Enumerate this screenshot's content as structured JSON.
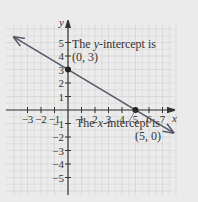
{
  "chart_data": {
    "type": "line",
    "title": "",
    "xlabel": "x",
    "ylabel": "y",
    "xlim": [
      -4,
      8
    ],
    "ylim": [
      -6,
      6
    ],
    "grid": true,
    "x_ticks": [
      -3,
      -2,
      -1,
      1,
      2,
      3,
      4,
      5,
      6,
      7
    ],
    "y_ticks": [
      -5,
      -4,
      -3,
      -2,
      -1,
      1,
      2,
      3,
      4,
      5
    ],
    "series": [
      {
        "name": "line",
        "equation": "y = -3/5 x + 3",
        "x": [
          -4.0,
          0,
          5,
          7.8
        ],
        "y": [
          5.4,
          3,
          0,
          -1.68
        ],
        "arrows": "both"
      }
    ],
    "points": [
      {
        "x": 0,
        "y": 3,
        "label": "(0, 3)"
      },
      {
        "x": 5,
        "y": 0,
        "label": "(5, 0)"
      }
    ],
    "annotations": [
      {
        "text_prefix": "The ",
        "var": "y",
        "text_suffix": "-intercept is",
        "point": "(0, 3)"
      },
      {
        "text_prefix": "The ",
        "var": "x",
        "text_suffix": "-intercept is",
        "point": "(5, 0)"
      }
    ]
  },
  "labels": {
    "x_axis": "x",
    "y_axis": "y",
    "ann_y_prefix": "The ",
    "ann_y_var": "y",
    "ann_y_suffix": "-intercept is",
    "ann_y_point": "(0, 3)",
    "ann_x_prefix": "The ",
    "ann_x_var": "x",
    "ann_x_suffix": "-intercept is",
    "ann_x_point": "(5, 0)"
  },
  "colors": {
    "background": "#ebebeb",
    "grid": "#d4d4d4",
    "axis": "#333333",
    "line": "#555a66"
  }
}
